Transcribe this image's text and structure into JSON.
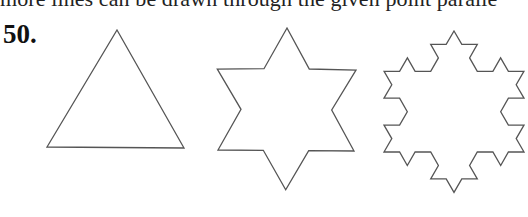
{
  "page": {
    "top_line_text": "more lines can be drawn through the given point paralle",
    "problem_number": "50."
  },
  "figures": [
    {
      "name": "triangle",
      "label": "Koch iteration 0 (triangle)",
      "iterations": 0,
      "apex": [
        117,
        30
      ],
      "base_left": [
        47,
        147
      ],
      "base_right": [
        184,
        148
      ]
    },
    {
      "name": "star",
      "label": "Koch iteration 1 (hexagram)",
      "iterations": 1,
      "apex": [
        287,
        28
      ],
      "base_left": [
        218,
        150
      ],
      "base_right": [
        354,
        151
      ]
    },
    {
      "name": "snowflake",
      "label": "Koch iteration 2 (snowflake)",
      "iterations": 2,
      "apex": [
        454,
        31
      ],
      "base_left": [
        384,
        152
      ],
      "base_right": [
        524,
        152
      ]
    }
  ],
  "colors": {
    "stroke": "#555555",
    "text": "#222222"
  }
}
